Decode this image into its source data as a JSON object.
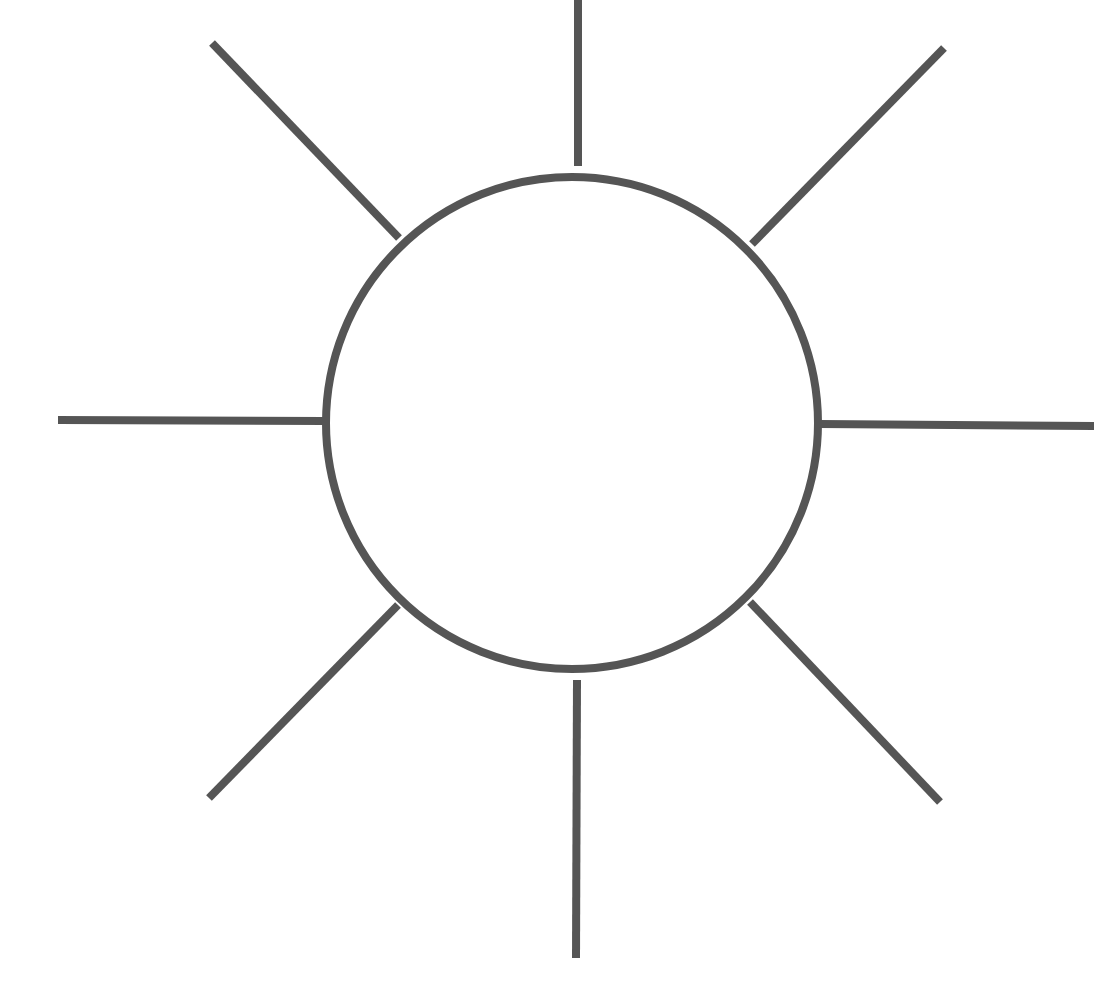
{
  "diagram": {
    "type": "radial-sun",
    "stroke_color": "#555555",
    "background": "#ffffff",
    "stroke_width": 8,
    "circle": {
      "cx": 572,
      "cy": 423,
      "r": 246
    },
    "rays": [
      {
        "name": "ray-top",
        "x1": 578,
        "y1": 0,
        "x2": 578,
        "y2": 166
      },
      {
        "name": "ray-top-right",
        "x1": 752,
        "y1": 244,
        "x2": 944,
        "y2": 48
      },
      {
        "name": "ray-right",
        "x1": 820,
        "y1": 424,
        "x2": 1094,
        "y2": 426
      },
      {
        "name": "ray-bottom-right",
        "x1": 750,
        "y1": 602,
        "x2": 940,
        "y2": 802
      },
      {
        "name": "ray-bottom",
        "x1": 577,
        "y1": 680,
        "x2": 576,
        "y2": 958
      },
      {
        "name": "ray-bottom-left",
        "x1": 398,
        "y1": 605,
        "x2": 209,
        "y2": 798
      },
      {
        "name": "ray-left",
        "x1": 324,
        "y1": 421,
        "x2": 58,
        "y2": 420
      },
      {
        "name": "ray-top-left",
        "x1": 399,
        "y1": 238,
        "x2": 212,
        "y2": 43
      }
    ]
  }
}
